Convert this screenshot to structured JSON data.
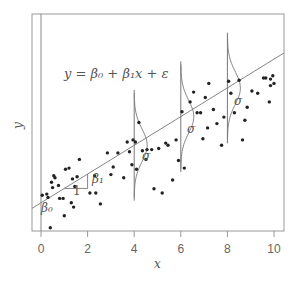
{
  "chart_data": {
    "type": "scatter",
    "title": "",
    "xlabel": "x",
    "ylabel": "y",
    "xlim": [
      -0.4,
      10.4
    ],
    "ylim": [
      0,
      10
    ],
    "x_ticks": [
      0,
      2,
      4,
      6,
      8,
      10
    ],
    "y_ticks": [],
    "grid": false,
    "legend": null,
    "equation": "y = β0 + β1x + ε",
    "regression_line": {
      "intercept": 1.3,
      "slope": 0.662
    },
    "annotations": [
      {
        "text": "β0",
        "x": 0.15,
        "y": 0.95
      },
      {
        "text": "1",
        "x": 1.5,
        "y": 1.9
      },
      {
        "text": "β1",
        "x": 2.35,
        "y": 2.45
      },
      {
        "text": "σ",
        "x": 4.5,
        "y": 3.6
      },
      {
        "text": "σ",
        "x": 6.45,
        "y": 4.85
      },
      {
        "text": "σ",
        "x": 8.45,
        "y": 6.15
      }
    ],
    "normal_curves": [
      {
        "x": 4,
        "mean": 3.95,
        "sd": 0.75
      },
      {
        "x": 6,
        "mean": 5.27,
        "sd": 0.75
      },
      {
        "x": 8,
        "mean": 6.59,
        "sd": 0.75
      }
    ],
    "points": [
      [
        0.05,
        1.65
      ],
      [
        0.25,
        1.7
      ],
      [
        0.3,
        1.55
      ],
      [
        0.4,
        0.15
      ],
      [
        0.45,
        2.25
      ],
      [
        0.5,
        2.0
      ],
      [
        0.55,
        2.55
      ],
      [
        0.6,
        2.45
      ],
      [
        0.75,
        2.1
      ],
      [
        0.8,
        1.5
      ],
      [
        0.95,
        1.5
      ],
      [
        1.0,
        0.7
      ],
      [
        1.05,
        2.85
      ],
      [
        1.2,
        2.9
      ],
      [
        1.3,
        1.3
      ],
      [
        1.35,
        2.4
      ],
      [
        1.4,
        1.1
      ],
      [
        1.45,
        2.05
      ],
      [
        1.55,
        2.5
      ],
      [
        1.65,
        3.3
      ],
      [
        2.1,
        1.75
      ],
      [
        2.3,
        2.55
      ],
      [
        2.35,
        1.75
      ],
      [
        2.55,
        1.25
      ],
      [
        2.85,
        3.6
      ],
      [
        3.0,
        2.6
      ],
      [
        3.1,
        2.95
      ],
      [
        3.3,
        3.6
      ],
      [
        3.55,
        2.45
      ],
      [
        3.7,
        4.1
      ],
      [
        3.8,
        3.65
      ],
      [
        3.9,
        3.05
      ],
      [
        3.95,
        4.2
      ],
      [
        4.05,
        4.1
      ],
      [
        4.1,
        2.85
      ],
      [
        4.2,
        5.0
      ],
      [
        4.35,
        3.7
      ],
      [
        4.5,
        3.3
      ],
      [
        4.55,
        3.75
      ],
      [
        4.75,
        3.75
      ],
      [
        4.85,
        1.95
      ],
      [
        5.05,
        3.8
      ],
      [
        5.2,
        1.75
      ],
      [
        5.35,
        4.05
      ],
      [
        5.45,
        3.95
      ],
      [
        5.65,
        2.35
      ],
      [
        5.8,
        4.2
      ],
      [
        5.9,
        3.25
      ],
      [
        6.05,
        5.5
      ],
      [
        6.15,
        2.9
      ],
      [
        6.4,
        5.95
      ],
      [
        6.55,
        6.4
      ],
      [
        6.7,
        5.45
      ],
      [
        6.85,
        5.45
      ],
      [
        6.95,
        4.25
      ],
      [
        7.05,
        6.15
      ],
      [
        7.15,
        4.75
      ],
      [
        7.2,
        6.8
      ],
      [
        7.4,
        5.6
      ],
      [
        7.55,
        4.95
      ],
      [
        7.75,
        3.95
      ],
      [
        7.85,
        5.25
      ],
      [
        8.05,
        6.9
      ],
      [
        8.15,
        6.35
      ],
      [
        8.3,
        5.45
      ],
      [
        8.5,
        6.95
      ],
      [
        8.65,
        4.2
      ],
      [
        8.75,
        5.1
      ],
      [
        8.85,
        5.7
      ],
      [
        9.05,
        6.45
      ],
      [
        9.3,
        6.35
      ],
      [
        9.55,
        7.05
      ],
      [
        9.65,
        7.05
      ],
      [
        9.8,
        5.95
      ],
      [
        9.85,
        7.0
      ],
      [
        9.95,
        7.15
      ],
      [
        10.0,
        6.8
      ],
      [
        9.85,
        6.7
      ]
    ]
  },
  "labels": {
    "equation": "y = β₀ + β₁x + ε",
    "xlabel": "x",
    "ylabel": "y",
    "beta0": "β₀",
    "beta1": "β₁",
    "one": "1",
    "sigma": "σ",
    "ticks": [
      "0",
      "2",
      "4",
      "6",
      "8",
      "10"
    ]
  }
}
